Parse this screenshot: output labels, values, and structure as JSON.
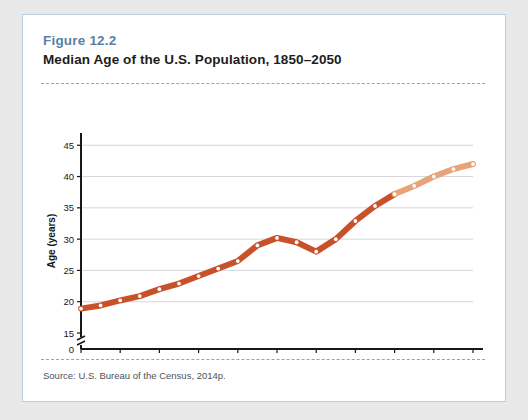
{
  "figure": {
    "number": "Figure 12.2",
    "title": "Median Age of the U.S. Population, 1850–2050",
    "source": "Source: U.S. Bureau of the Census, 2014p."
  },
  "colors": {
    "figure_number": "#5b7fa6",
    "card_border": "#b9cde0",
    "line_actual": "#c8512a",
    "line_projected": "#e8a479",
    "marker_fill": "#ffffff",
    "gridline": "#c9cdd1",
    "axis": "#16181a",
    "page_background": "#e8e8e8"
  },
  "annotations": {
    "estimated_label": "estimated"
  },
  "chart_data": {
    "type": "line",
    "title": "Median Age of the U.S. Population, 1850–2050",
    "xlabel": "",
    "ylabel": "Age (years)",
    "xlim": [
      1850,
      2050
    ],
    "ylim": [
      15,
      46
    ],
    "y_axis_break": true,
    "y_axis_zero_tick": "0",
    "grid": true,
    "grid_axis": "y",
    "legend": "none",
    "xticks": [
      1850,
      1870,
      1890,
      1910,
      1930,
      1950,
      1970,
      1990,
      2010,
      2030,
      2050
    ],
    "xtick_labels": [
      "1850",
      "1870",
      "1890",
      "1910",
      "1930",
      "1950",
      "1970",
      "1990",
      "2010",
      "2030",
      "2050"
    ],
    "yticks": [
      0,
      15,
      20,
      25,
      30,
      35,
      40,
      45
    ],
    "ytick_labels": [
      "0",
      "15",
      "20",
      "25",
      "30",
      "35",
      "40",
      "45"
    ],
    "x": [
      1850,
      1860,
      1870,
      1880,
      1890,
      1900,
      1910,
      1920,
      1930,
      1940,
      1950,
      1960,
      1970,
      1980,
      1990,
      2000,
      2010,
      2020,
      2030,
      2040,
      2050
    ],
    "values": [
      18.9,
      19.4,
      20.2,
      20.9,
      22.0,
      22.9,
      24.1,
      25.3,
      26.5,
      29.0,
      30.2,
      29.5,
      28.0,
      30.0,
      32.9,
      35.3,
      37.2,
      38.5,
      40.0,
      41.2,
      42.0
    ],
    "series": [
      {
        "name": "Median age (actual)",
        "color": "#c8512a",
        "x": [
          1850,
          1860,
          1870,
          1880,
          1890,
          1900,
          1910,
          1920,
          1930,
          1940,
          1950,
          1960,
          1970,
          1980,
          1990,
          2000,
          2010
        ],
        "values": [
          18.9,
          19.4,
          20.2,
          20.9,
          22.0,
          22.9,
          24.1,
          25.3,
          26.5,
          29.0,
          30.2,
          29.5,
          28.0,
          30.0,
          32.9,
          35.3,
          37.2
        ]
      },
      {
        "name": "Median age (estimated)",
        "color": "#e8a479",
        "x": [
          2010,
          2020,
          2030,
          2040,
          2050
        ],
        "values": [
          37.2,
          38.5,
          40.0,
          41.2,
          42.0
        ]
      }
    ],
    "estimated_range": [
      2030,
      2050
    ],
    "estimated_label": "estimated"
  }
}
